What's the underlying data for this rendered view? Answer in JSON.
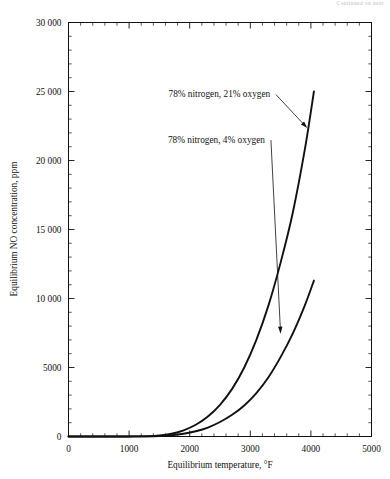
{
  "page": {
    "header_note": "Continued on next"
  },
  "chart_data": {
    "type": "line",
    "title": "",
    "xlabel": "Equilibrium temperature, °F",
    "ylabel": "Equilibrium NO concentration, ppm",
    "xlim": [
      0,
      5000
    ],
    "ylim": [
      0,
      30000
    ],
    "xticks": [
      0,
      1000,
      2000,
      3000,
      4000,
      5000
    ],
    "xticklabels": [
      "0",
      "1000",
      "2000",
      "3000",
      "4000",
      "5000"
    ],
    "yticks": [
      0,
      5000,
      10000,
      15000,
      20000,
      25000,
      30000
    ],
    "yticklabels": [
      "0",
      "5000",
      "10 000",
      "15 000",
      "20 000",
      "25 000",
      "30 000"
    ],
    "x_minor_step": 200,
    "y_minor_step": 1000,
    "grid": false,
    "legend_position": "inline-annotations",
    "series": [
      {
        "name": "78% nitrogen, 21% oxygen",
        "x": [
          0,
          500,
          1000,
          1300,
          1500,
          1700,
          1900,
          2100,
          2300,
          2500,
          2700,
          2900,
          3100,
          3300,
          3500,
          3700,
          3900,
          4050
        ],
        "values": [
          0,
          0,
          5,
          20,
          70,
          200,
          450,
          850,
          1450,
          2300,
          3450,
          5000,
          7000,
          9500,
          12600,
          16200,
          20800,
          25000
        ]
      },
      {
        "name": "78% nitrogen, 4% oxygen",
        "x": [
          0,
          500,
          1000,
          1300,
          1500,
          1700,
          1900,
          2100,
          2300,
          2500,
          2700,
          2900,
          3100,
          3300,
          3500,
          3700,
          3900,
          4050
        ],
        "values": [
          0,
          0,
          2,
          8,
          30,
          90,
          200,
          380,
          650,
          1050,
          1570,
          2250,
          3150,
          4300,
          5750,
          7450,
          9500,
          11300
        ]
      }
    ],
    "annotations": [
      {
        "text": "78% nitrogen, 21% oxygen",
        "text_x": 1650,
        "text_y": 24600,
        "target_x": 3940,
        "target_y": 22350
      },
      {
        "text": "78% nitrogen, 4% oxygen",
        "text_x": 1640,
        "text_y": 21300,
        "target_x": 3500,
        "target_y": 7450
      }
    ]
  }
}
